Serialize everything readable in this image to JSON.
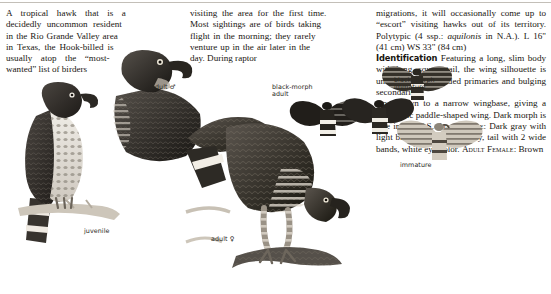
{
  "page": {
    "background": "#ffffff",
    "ink": "#18150f"
  },
  "columns": [
    {
      "id": "col1",
      "text": "A tropical hawk that is a decidedly uncommon resident in the Rio Grande Valley area in Texas, the Hook-billed is usually atop the “most-wanted” list of birders"
    },
    {
      "id": "col2",
      "text": "visiting the area for the first time. Most sightings are of birds taking flight in the morning; they rarely venture up in the air later in the day. During raptor"
    },
    {
      "id": "col3",
      "lead": "migrations, it will occasionally come up to “escort” visiting hawks out of its territory. Polytypic (4 ssp.: ",
      "sciname": "aquilonis",
      "lead2": " in N.A.). L 16\" (41 cm) WS 33\" (84 cm)",
      "section_head": "Identification",
      "body1": " Featuring a long, slim body with long, square tail, the wing silhouette is unique: Wide, rounded primaries and bulging secondaries",
      "body2": "taper down to a narrow wingbase, giving a diagnostic paddle-shaped wing. Dark morph is rare in the U.S. ",
      "sc_adult_male": "Adult Male",
      "body3": ": Dark gray with light barring across the belly, tail with 2 wide bands, white eye color. ",
      "sc_adult_female": "Adult Female",
      "body4": ": Brown"
    }
  ],
  "labels": [
    {
      "name": "juvenile",
      "text": "juvenile",
      "x": 84,
      "y": 228
    },
    {
      "name": "adult-male",
      "text": "adult ♂",
      "x": 151,
      "y": 86
    },
    {
      "name": "adult-female",
      "text": "adult ♀",
      "x": 211,
      "y": 238
    },
    {
      "name": "black-morph-adult",
      "text": "black-morph\nadult",
      "x": 272,
      "y": 86
    },
    {
      "name": "black-morph-immature",
      "text": "black-morph\nimmature",
      "x": 394,
      "y": 79
    },
    {
      "name": "immature",
      "text": "immature",
      "x": 400,
      "y": 164
    }
  ],
  "illustrations": [
    {
      "name": "perched-juvenile-hawk",
      "kind": "perched",
      "x": 8,
      "y": 82,
      "w": 112,
      "h": 160
    },
    {
      "name": "perched-adult-male-hawk",
      "kind": "perched",
      "x": 110,
      "y": 48,
      "w": 96,
      "h": 120
    },
    {
      "name": "perched-adult-female-hawk",
      "kind": "perched",
      "x": 190,
      "y": 96,
      "w": 160,
      "h": 180
    },
    {
      "name": "flying-black-morph-adult",
      "kind": "flying",
      "x": 288,
      "y": 92,
      "w": 74,
      "h": 52
    },
    {
      "name": "flying-black-morph-adult-2",
      "kind": "flying",
      "x": 340,
      "y": 88,
      "w": 74,
      "h": 54
    },
    {
      "name": "flying-black-morph-immature",
      "kind": "flying",
      "x": 384,
      "y": 60,
      "w": 70,
      "h": 50
    },
    {
      "name": "flying-immature-hawk",
      "kind": "flying",
      "x": 398,
      "y": 112,
      "w": 86,
      "h": 58
    }
  ]
}
